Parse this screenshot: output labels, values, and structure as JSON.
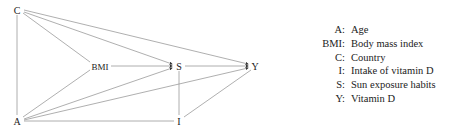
{
  "diagram": {
    "type": "directed acyclic graph",
    "nodes": [
      {
        "id": "C",
        "label": "C",
        "x": 17,
        "y": 10
      },
      {
        "id": "A",
        "label": "A",
        "x": 17,
        "y": 121
      },
      {
        "id": "BMI",
        "label": "BMI",
        "x": 100,
        "y": 66
      },
      {
        "id": "S",
        "label": "S",
        "x": 179,
        "y": 66
      },
      {
        "id": "Y",
        "label": "Y",
        "x": 255,
        "y": 66
      },
      {
        "id": "I",
        "label": "I",
        "x": 179,
        "y": 121
      }
    ],
    "edges": [
      {
        "from": "C",
        "to": "A"
      },
      {
        "from": "C",
        "to": "BMI"
      },
      {
        "from": "C",
        "to": "S"
      },
      {
        "from": "C",
        "to": "Y"
      },
      {
        "from": "A",
        "to": "BMI"
      },
      {
        "from": "A",
        "to": "S"
      },
      {
        "from": "A",
        "to": "Y"
      },
      {
        "from": "A",
        "to": "I"
      },
      {
        "from": "BMI",
        "to": "S"
      },
      {
        "from": "S",
        "to": "Y"
      },
      {
        "from": "S",
        "to": "I"
      },
      {
        "from": "I",
        "to": "Y"
      }
    ]
  },
  "legend": [
    {
      "key": "A:",
      "value": "Age"
    },
    {
      "key": "BMI:",
      "value": "Body mass index"
    },
    {
      "key": "C:",
      "value": "Country"
    },
    {
      "key": "I:",
      "value": "Intake of vitamin D"
    },
    {
      "key": "S:",
      "value": "Sun exposure habits"
    },
    {
      "key": "Y:",
      "value": "Vitamin D"
    }
  ]
}
